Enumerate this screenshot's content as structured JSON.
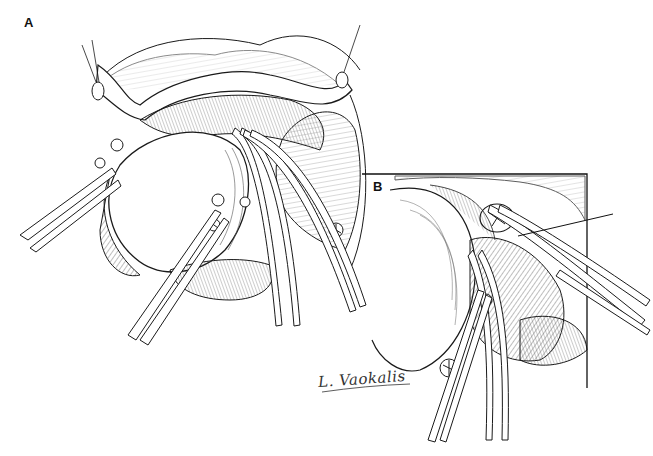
{
  "figure": {
    "panels": [
      {
        "id": "A",
        "label": "A"
      },
      {
        "id": "B",
        "label": "B"
      }
    ],
    "signature": "L. Vaokalis",
    "annotation": {
      "type": "leader-line",
      "target": "encircled structure in panel B"
    },
    "colors": {
      "ink": "#1a1a1a",
      "background": "#ffffff",
      "hatch": "#555555"
    }
  }
}
